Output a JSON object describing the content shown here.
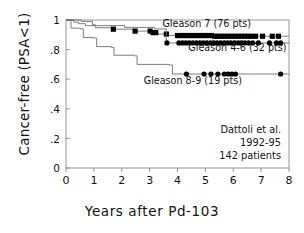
{
  "chart_data": {
    "type": "line",
    "subtype": "kaplan-meier-survival",
    "title": "",
    "xlabel": "Years  after  Pd-103",
    "ylabel": "Cancer-free  (PSA<1)",
    "xlim": [
      0,
      8
    ],
    "ylim": [
      0,
      1
    ],
    "xticks": [
      "0",
      "1",
      "2",
      "3",
      "4",
      "5",
      "6",
      "7",
      "8"
    ],
    "xtick_values": [
      0,
      1,
      2,
      3,
      4,
      5,
      6,
      7,
      8
    ],
    "yticks": [
      "0",
      ".2",
      ".4",
      ".6",
      ".8",
      "1"
    ],
    "ytick_values": [
      0,
      0.2,
      0.4,
      0.6,
      0.8,
      1
    ],
    "grid": false,
    "legend_position": "inline-annotations",
    "series": [
      {
        "name": "Gleason 7 (76 pts)",
        "label": "Gleason 7 (76 pts)",
        "n_patients": 76,
        "marker": "square",
        "color": "#000000",
        "final_value": 0.89,
        "steps": [
          [
            0.0,
            1.0
          ],
          [
            0.28,
            0.985
          ],
          [
            0.45,
            0.975
          ],
          [
            0.7,
            0.962
          ],
          [
            1.05,
            0.948
          ],
          [
            1.7,
            0.938
          ],
          [
            2.45,
            0.925
          ],
          [
            3.05,
            0.915
          ],
          [
            3.3,
            0.905
          ],
          [
            3.62,
            0.895
          ],
          [
            5.25,
            0.89
          ],
          [
            8.0,
            0.89
          ]
        ],
        "censor_marks": [
          1.7,
          2.48,
          3.02,
          3.12,
          3.22,
          3.6,
          4.0,
          4.12,
          4.22,
          4.32,
          4.44,
          4.55,
          4.66,
          4.78,
          4.9,
          5.0,
          5.1,
          5.22,
          5.34,
          5.46,
          5.58,
          5.7,
          5.82,
          5.94,
          6.06,
          6.18,
          6.3,
          6.42,
          6.54,
          6.66,
          6.8,
          7.05,
          7.4,
          7.62
        ]
      },
      {
        "name": "Gleason 4-6 (32 pts)",
        "label": "Gleason 4-6 (32 pts)",
        "n_patients": 32,
        "marker": "circle",
        "color": "#000000",
        "final_value": 0.845,
        "steps": [
          [
            0.0,
            1.0
          ],
          [
            0.55,
            0.99
          ],
          [
            0.95,
            0.968
          ],
          [
            1.05,
            0.962
          ],
          [
            2.1,
            0.95
          ],
          [
            3.18,
            0.94
          ],
          [
            3.6,
            0.845
          ],
          [
            8.0,
            0.845
          ]
        ],
        "censor_marks": [
          3.62,
          4.05,
          4.18,
          4.3,
          4.42,
          4.55,
          4.68,
          4.8,
          4.92,
          5.05,
          5.18,
          5.3,
          5.42,
          5.55,
          5.68,
          5.8,
          5.92,
          6.05,
          6.18,
          6.3,
          6.42,
          6.55,
          6.7,
          6.9,
          7.3,
          7.55,
          7.7
        ]
      },
      {
        "name": "Gleason 8-9 (19 pts)",
        "label": "Gleason 8-9 (19 pts)",
        "n_patients": 19,
        "marker": "circle",
        "color": "#000000",
        "final_value": 0.635,
        "steps": [
          [
            0.0,
            1.0
          ],
          [
            0.18,
            0.945
          ],
          [
            0.52,
            0.94
          ],
          [
            0.62,
            0.882
          ],
          [
            1.0,
            0.878
          ],
          [
            1.1,
            0.82
          ],
          [
            1.62,
            0.815
          ],
          [
            1.72,
            0.762
          ],
          [
            2.45,
            0.758
          ],
          [
            2.55,
            0.7
          ],
          [
            3.7,
            0.696
          ],
          [
            3.82,
            0.635
          ],
          [
            8.0,
            0.635
          ]
        ],
        "censor_marks": [
          4.32,
          4.95,
          5.2,
          5.45,
          5.68,
          5.82,
          5.95,
          6.08,
          7.7
        ]
      }
    ],
    "annotations": [
      {
        "id": "label-gleason-7",
        "text": "Gleason 7 (76 pts)",
        "x": 5.05,
        "y": 0.955,
        "anchor": "middle"
      },
      {
        "id": "label-gleason-46",
        "text": "Gleason 4-6 (32 pts)",
        "x": 6.15,
        "y": 0.79,
        "anchor": "middle"
      },
      {
        "id": "label-gleason-89",
        "text": "Gleason 8-9 (19 pts)",
        "x": 4.55,
        "y": 0.565,
        "anchor": "middle"
      }
    ],
    "source_note": {
      "line1": "Dattoli et al.",
      "line2": "1992-95",
      "line3": "142 patients"
    }
  }
}
